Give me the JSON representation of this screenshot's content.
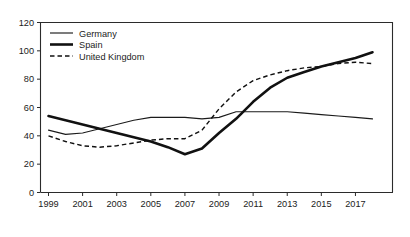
{
  "chart_data": {
    "type": "line",
    "title": "",
    "subtitle": "",
    "xlabel": "",
    "ylabel": "",
    "xlim": [
      1999,
      2018
    ],
    "ylim": [
      0,
      120
    ],
    "grid": false,
    "legend_position": "top-left",
    "x": [
      1999,
      2000,
      2001,
      2002,
      2003,
      2004,
      2005,
      2006,
      2007,
      2008,
      2009,
      2010,
      2011,
      2012,
      2013,
      2014,
      2015,
      2016,
      2017,
      2018
    ],
    "xtick_labels": [
      "1999",
      "2001",
      "2003",
      "2005",
      "2007",
      "2009",
      "2011",
      "2013",
      "2015",
      "2017"
    ],
    "xtick_values": [
      1999,
      2001,
      2003,
      2005,
      2007,
      2009,
      2011,
      2013,
      2015,
      2017
    ],
    "ytick_labels": [
      "0",
      "20",
      "40",
      "60",
      "80",
      "100",
      "120"
    ],
    "ytick_values": [
      0,
      20,
      40,
      60,
      80,
      100,
      120
    ],
    "series": [
      {
        "name": "Germany",
        "style": "thin-solid",
        "values": [
          44,
          41,
          42,
          45,
          48,
          51,
          53,
          53,
          53,
          52,
          53,
          57,
          57,
          57,
          57,
          56,
          55,
          54,
          53,
          52
        ]
      },
      {
        "name": "Spain",
        "style": "thick-solid",
        "values": [
          54,
          51,
          48,
          45,
          42,
          39,
          36,
          32,
          27,
          31,
          42,
          52,
          64,
          74,
          81,
          85,
          89,
          92,
          95,
          99
        ]
      },
      {
        "name": "United Kingdom",
        "style": "dashed",
        "values": [
          40,
          36,
          33,
          32,
          33,
          35,
          37,
          38,
          38,
          44,
          59,
          71,
          79,
          83,
          86,
          88,
          89,
          91,
          92,
          91
        ]
      }
    ]
  },
  "legend": {
    "items": [
      {
        "label": "Germany"
      },
      {
        "label": "Spain"
      },
      {
        "label": "United Kingdom"
      }
    ]
  }
}
